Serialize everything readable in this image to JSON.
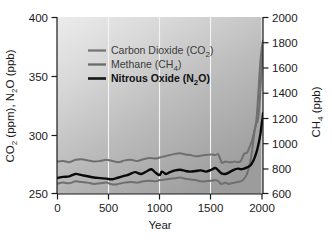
{
  "chart_data": {
    "type": "line",
    "title": "",
    "xlabel": "Year",
    "ylabel_left": "CO2 (ppm), N2O (ppb)",
    "ylabel_right": "CH4 (ppb)",
    "xlim": [
      0,
      2005
    ],
    "ylim_left": [
      250,
      400
    ],
    "ylim_right": [
      600,
      2000
    ],
    "xticks": [
      0,
      500,
      1000,
      1500,
      2000
    ],
    "xtick_labels": [
      "0",
      "500",
      "1000",
      "1500",
      "2000"
    ],
    "yticks_left": [
      250,
      300,
      350,
      400
    ],
    "ytick_labels_left": [
      "250",
      "300",
      "350",
      "400"
    ],
    "yticks_right": [
      600,
      800,
      1000,
      1200,
      1400,
      1600,
      1800,
      2000
    ],
    "ytick_labels_right": [
      "600",
      "800",
      "1000",
      "1200",
      "1400",
      "1600",
      "1800",
      "2000"
    ],
    "grid": "vertical-white-at-xticks",
    "legend_position": "upper-left-inside",
    "background": "gray-gradient-light-topleft-to-dark-bottomright",
    "series": [
      {
        "name": "Carbon Dioxide (CO2)",
        "axis": "left",
        "unit": "ppm",
        "color": "#6f6f6f",
        "linewidth": 2.0,
        "x": [
          0,
          60,
          120,
          180,
          240,
          300,
          360,
          420,
          480,
          540,
          600,
          660,
          720,
          780,
          840,
          900,
          960,
          1000,
          1050,
          1100,
          1150,
          1200,
          1250,
          1300,
          1350,
          1400,
          1450,
          1500,
          1540,
          1570,
          1600,
          1610,
          1640,
          1670,
          1700,
          1730,
          1760,
          1790,
          1820,
          1850,
          1880,
          1900,
          1920,
          1940,
          1950,
          1960,
          1970,
          1980,
          1990,
          2000,
          2005
        ],
        "y": [
          277.5,
          278.0,
          277.0,
          279.0,
          279.5,
          278.5,
          277.5,
          278.0,
          279.0,
          278.0,
          277.0,
          278.5,
          279.0,
          278.0,
          279.5,
          280.5,
          280.0,
          281.0,
          282.0,
          283.0,
          284.0,
          284.5,
          283.5,
          283.0,
          282.0,
          282.5,
          283.0,
          283.5,
          283.0,
          283.5,
          277.0,
          276.5,
          277.5,
          277.0,
          277.0,
          277.5,
          277.0,
          278.0,
          284.0,
          285.0,
          291.0,
          296.0,
          303.0,
          310.0,
          311.0,
          316.0,
          325.0,
          338.5,
          354.0,
          369.0,
          380.0
        ]
      },
      {
        "name": "Methane (CH4)",
        "axis": "right",
        "unit": "ppb",
        "color": "#6f6f6f",
        "linewidth": 2.0,
        "x": [
          0,
          60,
          120,
          180,
          240,
          300,
          360,
          420,
          480,
          520,
          560,
          600,
          660,
          720,
          780,
          840,
          900,
          960,
          1000,
          1050,
          1100,
          1150,
          1200,
          1250,
          1300,
          1350,
          1400,
          1450,
          1500,
          1540,
          1570,
          1600,
          1640,
          1670,
          1700,
          1730,
          1760,
          1790,
          1820,
          1850,
          1880,
          1900,
          1920,
          1940,
          1950,
          1960,
          1970,
          1980,
          1990,
          2000,
          2005
        ],
        "y": [
          680,
          690,
          685,
          700,
          695,
          690,
          680,
          685,
          690,
          680,
          675,
          680,
          690,
          695,
          690,
          700,
          705,
          700,
          710,
          715,
          720,
          725,
          730,
          720,
          715,
          710,
          700,
          700,
          705,
          710,
          700,
          680,
          690,
          680,
          685,
          690,
          695,
          700,
          720,
          760,
          850,
          950,
          1080,
          1180,
          1280,
          1400,
          1530,
          1650,
          1730,
          1790,
          1810
        ]
      },
      {
        "name": "Nitrous Oxide (N2O)",
        "axis": "left",
        "unit": "ppb",
        "color": "#0a0a0a",
        "linewidth": 2.4,
        "x": [
          0,
          60,
          120,
          180,
          240,
          300,
          360,
          420,
          480,
          540,
          600,
          660,
          700,
          760,
          820,
          880,
          920,
          960,
          1000,
          1020,
          1060,
          1100,
          1150,
          1200,
          1250,
          1300,
          1350,
          1400,
          1450,
          1500,
          1540,
          1570,
          1600,
          1640,
          1680,
          1720,
          1760,
          1790,
          1820,
          1850,
          1880,
          1900,
          1920,
          1940,
          1950,
          1960,
          1970,
          1980,
          1990,
          2000,
          2005
        ],
        "y": [
          263.5,
          264.5,
          265.0,
          267.0,
          266.0,
          265.0,
          264.0,
          263.5,
          263.0,
          262.5,
          264.0,
          265.5,
          266.5,
          268.5,
          267.0,
          269.5,
          271.0,
          268.0,
          266.0,
          269.0,
          267.0,
          268.5,
          270.0,
          270.5,
          269.5,
          269.0,
          269.5,
          270.0,
          269.0,
          270.5,
          272.0,
          270.0,
          267.5,
          267.0,
          268.5,
          270.5,
          271.5,
          271.0,
          271.5,
          272.5,
          274.0,
          276.5,
          280.0,
          285.0,
          288.0,
          292.0,
          296.0,
          301.0,
          307.5,
          314.0,
          318.5
        ]
      }
    ]
  },
  "axes": {
    "left": {
      "title_parts": [
        "CO",
        "2",
        " (ppm), N",
        "2",
        "O (ppb)"
      ]
    },
    "right": {
      "title_parts": [
        "CH",
        "4",
        " (ppb)"
      ]
    },
    "x": {
      "title": "Year"
    }
  },
  "legend": {
    "items": [
      {
        "label_parts": [
          "Carbon Dioxide (CO",
          "2",
          ")"
        ],
        "swatch_color": "#767676",
        "bold": false,
        "name": "legend-item-carbon-dioxide"
      },
      {
        "label_parts": [
          "Methane (CH",
          "4",
          ")"
        ],
        "swatch_color": "#6a6a6a",
        "bold": false,
        "name": "legend-item-methane"
      },
      {
        "label_parts": [
          "Nitrous Oxide (N",
          "2",
          "O)"
        ],
        "swatch_color": "#141414",
        "bold": true,
        "name": "legend-item-nitrous-oxide"
      }
    ]
  },
  "colors": {
    "co2_line": "#6f6f6f",
    "ch4_line": "#6f6f6f",
    "n2o_line": "#0a0a0a",
    "gridline": "#f2f2f2",
    "axis": "#1a1a1a",
    "plot_bg_light": "#e8e8e8",
    "plot_bg_dark": "#9b9b9b",
    "page_bg": "#ffffff"
  }
}
